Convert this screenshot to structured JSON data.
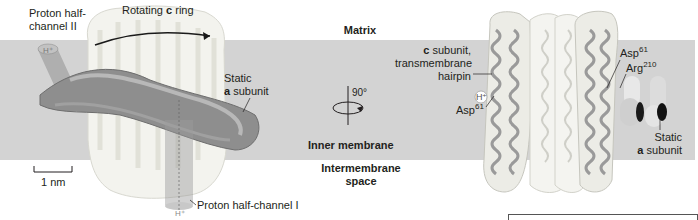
{
  "figure": {
    "regions": {
      "matrix": "Matrix",
      "inner_membrane": "Inner membrane",
      "intermembrane_line1": "Intermembrane",
      "intermembrane_line2": "space"
    },
    "left_panel": {
      "proton_half_channel_2_line1": "Proton half-",
      "proton_half_channel_2_line2": "channel II",
      "rotating_ring_prefix": "Rotating ",
      "rotating_ring_bold": "c",
      "rotating_ring_suffix": " ring",
      "static_a_line1": "Static",
      "static_a_bold": "a",
      "static_a_suffix": " subunit",
      "proton_half_channel_1": "Proton half-channel I",
      "h_plus_top": "H⁺",
      "h_plus_bottom": "H⁺",
      "scale_bar_label": "1 nm"
    },
    "rotation": {
      "angle_label": "90°"
    },
    "right_panel": {
      "c_subunit_bold": "c",
      "c_subunit_line1_suffix": " subunit,",
      "c_subunit_line2": "transmembrane",
      "c_subunit_line3": "hairpin",
      "h_plus": "H⁺",
      "asp61_left_base": "Asp",
      "asp61_left_sup": "61",
      "asp61_right_base": "Asp",
      "asp61_right_sup": "61",
      "arg210_base": "Arg",
      "arg210_sup": "210",
      "static_a_line1": "Static",
      "static_a_bold": "a",
      "static_a_suffix": " subunit"
    }
  },
  "colors": {
    "membrane": "#d3d3d3",
    "protein_light": "#f1f1ea",
    "protein_dark": "#8c8c8c",
    "helix": "#9a9a9a",
    "text": "#231f20"
  }
}
